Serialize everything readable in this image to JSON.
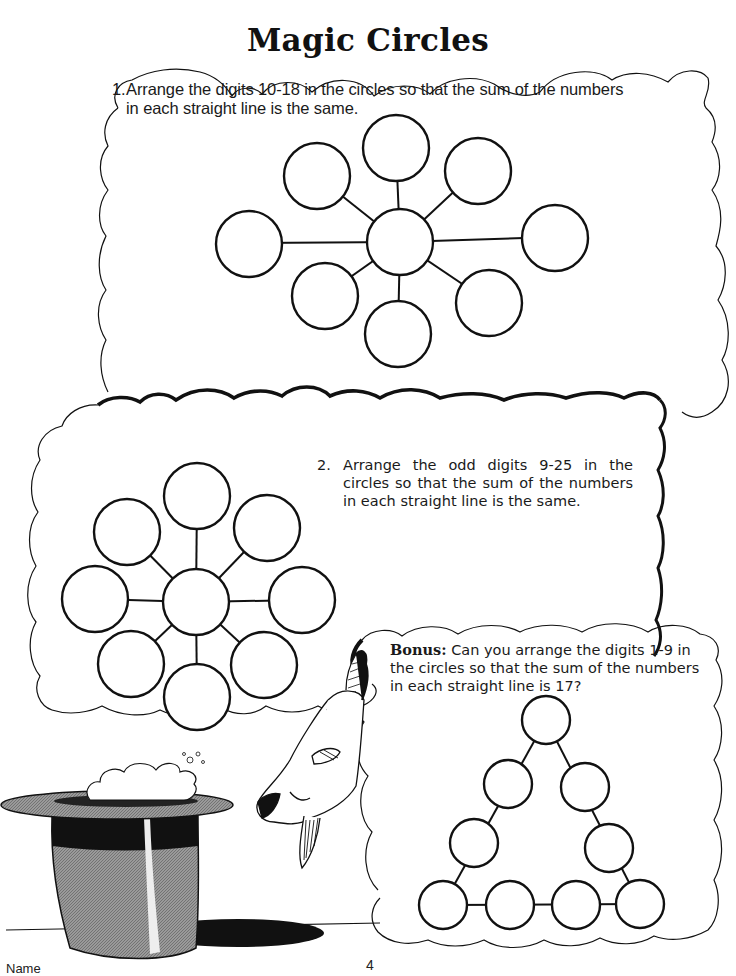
{
  "page": {
    "title": "Magic Circles",
    "footer_name_label": "Name",
    "page_number": "4"
  },
  "puzzles": [
    {
      "number": "1.",
      "text": "Arrange the digits 10-18 in the circles so that the sum of the numbers in each straight line is the same.",
      "circle_count": 9,
      "layout": "star-8-spokes"
    },
    {
      "number": "2.",
      "text": "Arrange the odd digits 9-25 in the circles so that the sum of the numbers in each straight line is the same.",
      "circle_count": 9,
      "layout": "star-8-spokes"
    },
    {
      "label": "Bonus:",
      "text": "Can you arrange the digits 1-9 in the circles so that the sum of the numbers in each straight line is 17?",
      "circle_count": 9,
      "layout": "triangle"
    }
  ],
  "illustration": {
    "items": [
      "magic-top-hat",
      "goat-head",
      "thought-clouds"
    ]
  },
  "colors": {
    "ink": "#111111",
    "paper": "#ffffff",
    "hat_gray": "#8a8a8a"
  }
}
